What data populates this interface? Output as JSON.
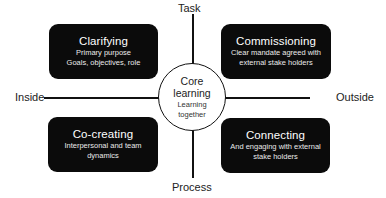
{
  "axes": {
    "top": "Task",
    "bottom": "Process",
    "left": "Inside",
    "right": "Outside"
  },
  "center": {
    "title_line1": "Core",
    "title_line2": "learning",
    "sub_line1": "Learning",
    "sub_line2": "together"
  },
  "quadrants": [
    {
      "position": "top-left",
      "title": "Clarifying",
      "line1": "Primary purpose",
      "line2": "Goals, objectives, role"
    },
    {
      "position": "top-right",
      "title": "Commissioning",
      "line1": "Clear mandate agreed with",
      "line2": "external stake holders"
    },
    {
      "position": "bottom-left",
      "title": "Co-creating",
      "line1": "Interpersonal and team",
      "line2": "dynamics"
    },
    {
      "position": "bottom-right",
      "title": "Connecting",
      "line1": "And engaging with external",
      "line2": "stake holders"
    }
  ],
  "colors": {
    "box_fill": "#0b0b0b",
    "box_text": "#ffffff",
    "line": "#111111",
    "background": "#ffffff"
  }
}
